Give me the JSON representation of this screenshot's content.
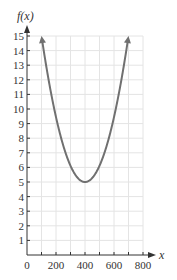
{
  "chart_data": {
    "type": "line",
    "title": "",
    "xlabel": "x",
    "ylabel": "f(x)",
    "xlim": [
      0,
      800
    ],
    "ylim": [
      0,
      15
    ],
    "grid": true,
    "x_ticks": [
      0,
      200,
      400,
      600,
      800
    ],
    "x_minor_ticks": [
      100,
      300,
      500,
      700
    ],
    "y_ticks": [
      1,
      2,
      3,
      4,
      5,
      6,
      7,
      8,
      9,
      10,
      11,
      12,
      13,
      14,
      15
    ],
    "x_tick_labels": [
      "0",
      "200",
      "400",
      "600",
      "800"
    ],
    "y_tick_labels": [
      "1",
      "2",
      "3",
      "4",
      "5",
      "6",
      "7",
      "8",
      "9",
      "10",
      "11",
      "12",
      "13",
      "14",
      "15"
    ],
    "series": [
      {
        "name": "f(x)",
        "description": "upward-opening parabola with vertex at (400, 5), arrows at both ends",
        "vertex": [
          400,
          5
        ],
        "x": [
          100,
          150,
          200,
          250,
          300,
          350,
          400,
          450,
          500,
          550,
          600,
          650,
          700
        ],
        "y": [
          15,
          11.94,
          9.44,
          7.5,
          6.11,
          5.28,
          5,
          5.28,
          6.11,
          7.5,
          9.44,
          11.94,
          15
        ],
        "color": "#707070",
        "end_arrows": true
      }
    ]
  }
}
